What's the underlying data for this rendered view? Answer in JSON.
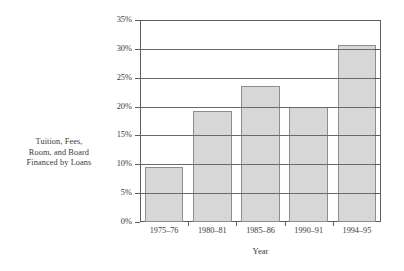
{
  "chart_data": {
    "type": "bar",
    "title": "",
    "categories": [
      "1975–76",
      "1980–81",
      "1985–86",
      "1990–91",
      "1994–95"
    ],
    "values": [
      9.5,
      19.3,
      23.5,
      19.9,
      30.6
    ],
    "xlabel": "Year",
    "ylabel": "Tuition, Fees, Room, and Board Financed by Loans",
    "ylabel_lines": [
      "Tuition, Fees,",
      "Room, and Board",
      "Financed by Loans"
    ],
    "ylim": [
      0,
      35
    ],
    "ytick_values": [
      0,
      5,
      10,
      15,
      20,
      25,
      30,
      35
    ],
    "ytick_labels": [
      "0%",
      "5%",
      "10%",
      "15%",
      "20%",
      "25%",
      "30%",
      "35%"
    ],
    "grid": true,
    "grid_axis": "y",
    "legend": false,
    "bar_fill_color": "#d7d7d7",
    "bar_edge_color": "#8d8d8d",
    "axis_color": "#5e5e5e",
    "background_color": "#ffffff"
  }
}
